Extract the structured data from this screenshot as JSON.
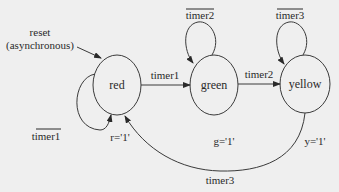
{
  "diagram": {
    "type": "finite-state-machine",
    "background": "#efefef",
    "line_color": "#3a3a3a",
    "states": [
      {
        "id": "red",
        "label": "red",
        "output": "r='1'"
      },
      {
        "id": "green",
        "label": "green",
        "output": "g='1'"
      },
      {
        "id": "yellow",
        "label": "yellow",
        "output": "y='1'"
      }
    ],
    "reset": {
      "line1": "reset",
      "line2": "(asynchronous)",
      "target": "red"
    },
    "transitions": [
      {
        "from": "red",
        "to": "red",
        "label": "timer1",
        "negated": true
      },
      {
        "from": "red",
        "to": "green",
        "label": "timer1",
        "negated": false
      },
      {
        "from": "green",
        "to": "green",
        "label": "timer2",
        "negated": true
      },
      {
        "from": "green",
        "to": "yellow",
        "label": "timer2",
        "negated": false
      },
      {
        "from": "yellow",
        "to": "yellow",
        "label": "timer3",
        "negated": true
      },
      {
        "from": "yellow",
        "to": "red",
        "label": "timer3",
        "negated": false
      }
    ]
  }
}
